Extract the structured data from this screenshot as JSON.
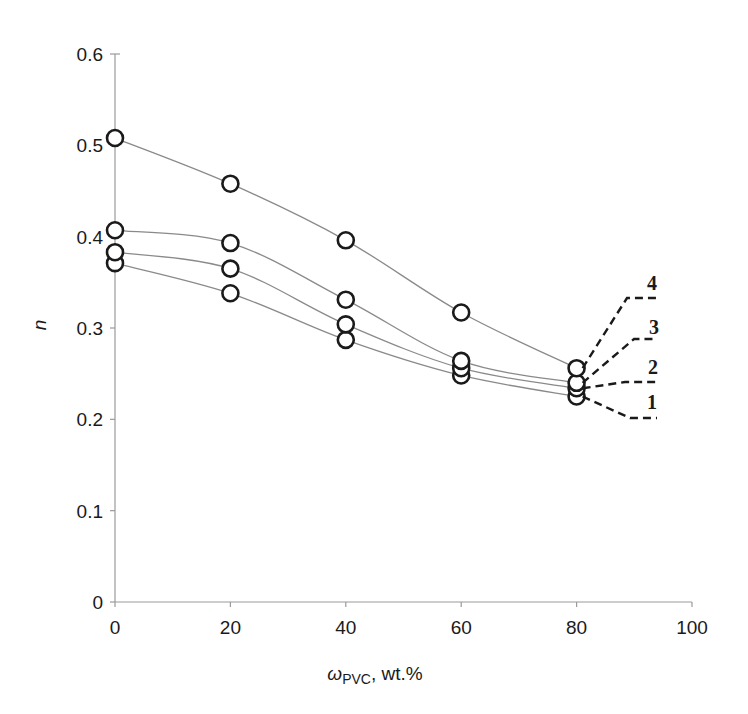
{
  "chart_data": {
    "type": "line",
    "title": "",
    "xlabel": "ωPVC, wt.%",
    "xlabel_main": "ω",
    "xlabel_sub": "PVC",
    "xlabel_tail": ", wt.%",
    "ylabel": "n",
    "xlim": [
      0,
      100
    ],
    "ylim": [
      0,
      0.6
    ],
    "x_ticks": [
      "0",
      "20",
      "40",
      "60",
      "80",
      "100"
    ],
    "y_ticks": [
      "0",
      "0.1",
      "0.2",
      "0.3",
      "0.4",
      "0.5",
      "0.6"
    ],
    "grid": false,
    "legend_position": "inline-right",
    "x": [
      0,
      20,
      40,
      60,
      80
    ],
    "series": [
      {
        "name": "1",
        "values": [
          0.371,
          0.338,
          0.287,
          0.248,
          0.225
        ]
      },
      {
        "name": "2",
        "values": [
          0.383,
          0.365,
          0.304,
          0.256,
          0.234
        ]
      },
      {
        "name": "3",
        "values": [
          0.407,
          0.393,
          0.331,
          0.264,
          0.24
        ]
      },
      {
        "name": "4",
        "values": [
          0.508,
          0.458,
          0.396,
          0.317,
          0.256
        ]
      }
    ],
    "colors": {
      "line": "#8a8a8a",
      "marker": "#1a1a1a",
      "axis": "#9a9a9a",
      "leader": "#1a1a1a"
    }
  }
}
